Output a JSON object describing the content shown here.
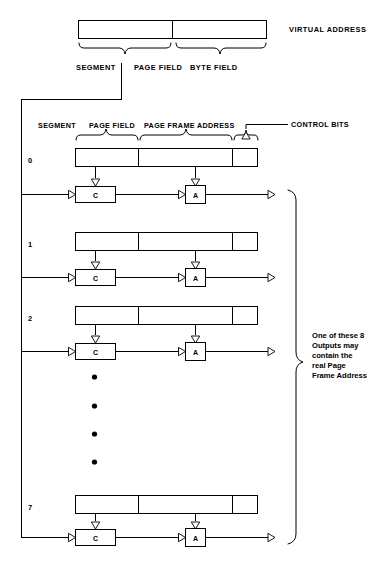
{
  "figure": {
    "virtual_address": {
      "label": "VIRTUAL ADDRESS",
      "field_labels": [
        "SEGMENT",
        "PAGE FIELD",
        "BYTE FIELD"
      ]
    },
    "table": {
      "column_labels": [
        "SEGMENT",
        "PAGE FIELD",
        "PAGE FRAME ADDRESS"
      ],
      "callout_label": "CONTROL BITS",
      "row_indices": [
        "0",
        "1",
        "2",
        "7"
      ],
      "ellipsis_dots": 4,
      "compare_box_label": "C",
      "and_box_label": "A"
    },
    "output_note": {
      "lines": [
        "One of these 8",
        "Outputs may",
        "contain the",
        "real Page",
        "Frame Address"
      ]
    },
    "colors": {
      "ink": "#000000",
      "paper": "#ffffff"
    }
  }
}
